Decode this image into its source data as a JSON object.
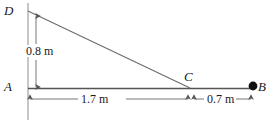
{
  "figure": {
    "background_color": "#ffffff",
    "line_color": "#555555",
    "text_color": "#1a1a1a",
    "ball_color": "#111111"
  },
  "points": {
    "D": {
      "label": "D",
      "x": 28,
      "y": 11
    },
    "A": {
      "label": "A",
      "x": 28,
      "y": 88
    },
    "C": {
      "label": "C",
      "x": 190,
      "y": 88
    },
    "B": {
      "label": "B",
      "x": 253,
      "y": 86
    }
  },
  "dimensions": {
    "height_AD": {
      "label": "0.8 m",
      "value": 0.8,
      "unit": "m",
      "from": "A",
      "to": "D"
    },
    "length_AC": {
      "label": "1.7 m",
      "value": 1.7,
      "unit": "m",
      "from": "A",
      "to": "C"
    },
    "length_CB": {
      "label": "0.7 m",
      "value": 0.7,
      "unit": "m",
      "from": "C",
      "to": "B"
    }
  },
  "elements": {
    "vertical_line": "vertical-line-through-A-and-D",
    "baseline": "horizontal-baseline-A-to-B",
    "hypotenuse": "slanted-line-D-to-C",
    "ball": "ball-at-B"
  }
}
